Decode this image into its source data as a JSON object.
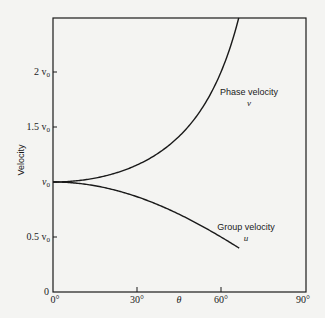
{
  "chart_data": {
    "type": "line",
    "title": "",
    "xlabel": "θ",
    "ylabel": "Velocity",
    "xlim": [
      0,
      90
    ],
    "ylim": [
      0,
      2.49
    ],
    "x_ticks": [
      "0°",
      "30°",
      "60°",
      "90°"
    ],
    "y_ticks": [
      "0",
      "0.5 v0",
      "v0",
      "1.5 v0",
      "2 v0"
    ],
    "y_tick_values": [
      0,
      0.5,
      1.0,
      1.5,
      2.0
    ],
    "grid": false,
    "legend": "none (inline curve labels)",
    "x": [
      0,
      10,
      20,
      30,
      40,
      50,
      60,
      66.4,
      70,
      80,
      90
    ],
    "series": [
      {
        "name": "Phase velocity v",
        "formula": "v0 / cos(θ)",
        "values": [
          1.0,
          1.015,
          1.064,
          1.155,
          1.305,
          1.556,
          2.0,
          2.49,
          null,
          null,
          null
        ]
      },
      {
        "name": "Group velocity u",
        "formula": "v0 · cos(θ)",
        "values": [
          1.0,
          0.985,
          0.94,
          0.866,
          0.766,
          0.643,
          0.5,
          0.4,
          0.342,
          0.174,
          0.0
        ]
      }
    ],
    "annotations": [
      {
        "text": "Phase velocity",
        "sub": "v"
      },
      {
        "text": "Group velocity",
        "sub": "u"
      }
    ]
  },
  "labels": {
    "ylabel": "Velocity",
    "xlabel": "θ",
    "yt0": "0",
    "yt05": "0.5 v",
    "yt1": "v",
    "yt15": "1.5 v",
    "yt2": "2 v",
    "sub0": "0",
    "xt0": "0°",
    "xt30": "30°",
    "xt60": "60°",
    "xt90": "90°",
    "phase_name": "Phase velocity",
    "phase_sym": "v",
    "group_name": "Group velocity",
    "group_sym": "u"
  },
  "colors": {
    "line": "#1a1a1a",
    "background": "#f4f4f2"
  }
}
